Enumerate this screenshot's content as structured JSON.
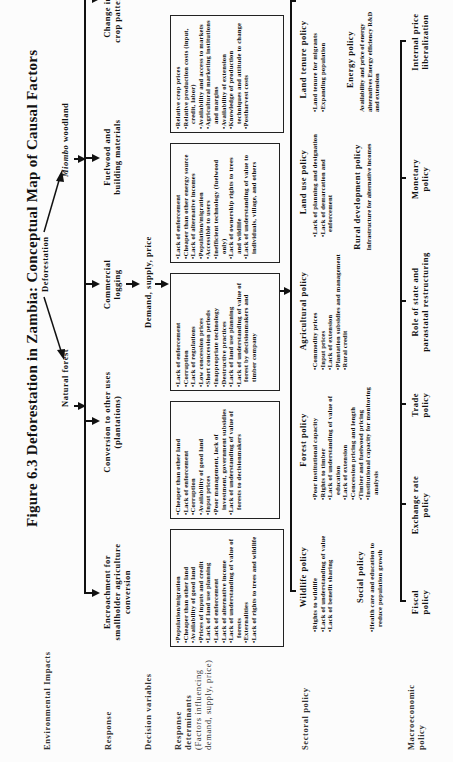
{
  "figure": {
    "title": "Figure 6.3 Deforestation in Zambia: Conceptual Map of Causal Factors"
  },
  "row_labels": {
    "environmental_impacts": "Environmental Impacts",
    "response": "Response",
    "decision_variables": "Decision variables",
    "response_determinants": "Response determinants",
    "response_determinants_sub": "(Factors influencing demand, supply, price)",
    "sectoral_policy": "Sectoral policy",
    "macroeconomic_policy": "Macroeconomic policy"
  },
  "impacts": {
    "natural_forest": "Natural forest",
    "deforestation": "Deforestation",
    "miombo_woodland_italic": "Miombo",
    "miombo_woodland_rest": " woodland"
  },
  "responses": [
    {
      "label": "Encroachment for smallholder agriculture conversion"
    },
    {
      "label": "Conversion to other uses (plantations)"
    },
    {
      "label": "Commercial logging"
    },
    {
      "label": "Fuelwood and building materials"
    },
    {
      "label": "Change in crop pattern"
    }
  ],
  "decision_variables": {
    "label": "Demand, supply, price"
  },
  "determinants": [
    {
      "items": [
        "Population/migration",
        "Cheaper than other land",
        "Availability of good land",
        "Prices of inputs and credit",
        "Lack of land use planning",
        "Lack of enforcement",
        "Lack of alternative income",
        "Lack of understanding of value of forests",
        "Externalities",
        "Lack of rights to trees and wildlife"
      ]
    },
    {
      "items": [
        "Cheaper than other land",
        "Lack of enforcement",
        "Corruption",
        "Availability of good land",
        "Input prices",
        "Poor management, lack of investment, government subsidies",
        "Lack of understanding of value of forests to decisionmakers"
      ]
    },
    {
      "items": [
        "Lack of enforcement",
        "Corruption",
        "Lack of regulations",
        "Low concession prices",
        "Short concession periods",
        "Inappropriate technology",
        "Destructive practices",
        "Lack of land use planning",
        "Lack of understanding of value of forest by decisionmakers and timber company"
      ]
    },
    {
      "items": [
        "Lack of enforcement",
        "Cheaper than other energy source",
        "Lack of alternative incomes",
        "Population/migration",
        "Accessible to users",
        "Inefficient technology (fuelwood only)",
        "Lack of ownership rights to trees and wildlife",
        "Lack of understanding of value to individuals, village, and others"
      ]
    },
    {
      "items": [
        "Relative crop prices",
        "Relative production costs (input, credit, labor)",
        "Availability and access to markets",
        "Agricultural marketing institutions and margins",
        "Availability of extension",
        "Knowledge of production techniques and attitude to change",
        "Postharvest costs"
      ]
    }
  ],
  "sectoral_policies": {
    "wildlife": {
      "title": "Wildlife policy",
      "items": [
        "Rights to wildlife",
        "Lack of understanding of value",
        "Lack of benefit sharing"
      ]
    },
    "social": {
      "title": "Social policy",
      "items": [
        "Health care and education to reduce population growth"
      ]
    },
    "forest": {
      "title": "Forest policy",
      "items": [
        "Poor institutional capacity",
        "Rights to timber",
        "Lack of understanding of value of education",
        "Lack of extension",
        "Concession pricing and length",
        "Timber and fuelwood pricing",
        "Institutional capacity for monitoring analysis"
      ]
    },
    "agricultural": {
      "title": "Agricultural policy",
      "items": [
        "Commodity prices",
        "Input prices",
        "Lack of extension",
        "Plantation subsidies and management",
        "Rural credit"
      ]
    },
    "land_use": {
      "title": "Land use policy",
      "items": [
        "Lack of planning and designation",
        "Lack of demarcation and enforcement"
      ]
    },
    "rural_development": {
      "title": "Rural development policy",
      "text": "Infrastructure for alternative incomes"
    },
    "land_tenure": {
      "title": "Land tenure policy",
      "items": [
        "Land tenure for migrants",
        "Expanding population"
      ]
    },
    "energy": {
      "title": "Energy policy",
      "text": "Availability and price of energy alternatives Energy efficiency R&D and extension"
    }
  },
  "macroeconomic_policies": [
    {
      "label": "Fiscal policy"
    },
    {
      "label": "Exchange rate policy"
    },
    {
      "label": "Trade policy"
    },
    {
      "label": "Role of state and parastatal restructuring"
    },
    {
      "label": "Monetary policy"
    },
    {
      "label": "Internal price liberalization"
    }
  ]
}
